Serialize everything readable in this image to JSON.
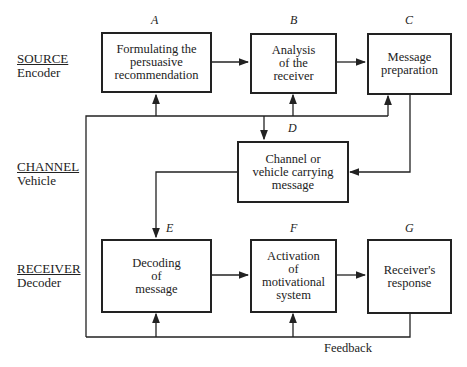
{
  "rows": [
    {
      "title": "SOURCE",
      "subtitle": "Encoder"
    },
    {
      "title": "CHANNEL",
      "subtitle": "Vehicle"
    },
    {
      "title": "RECEIVER",
      "subtitle": "Decoder"
    }
  ],
  "boxes": {
    "A": {
      "letter": "A",
      "text": "Formulating the\npersuasive\nrecommendation"
    },
    "B": {
      "letter": "B",
      "text": "Analysis\nof the\nreceiver"
    },
    "C": {
      "letter": "C",
      "text": "Message\npreparation"
    },
    "D": {
      "letter": "D",
      "text": "Channel or\nvehicle carrying\nmessage"
    },
    "E": {
      "letter": "E",
      "text": "Decoding\nof\nmessage"
    },
    "F": {
      "letter": "F",
      "text": "Activation\nof\nmotivational\nsystem"
    },
    "G": {
      "letter": "G",
      "text": "Receiver's\nresponse"
    }
  },
  "feedback_label": "Feedback",
  "colors": {
    "line": "#222222",
    "background": "#ffffff"
  }
}
